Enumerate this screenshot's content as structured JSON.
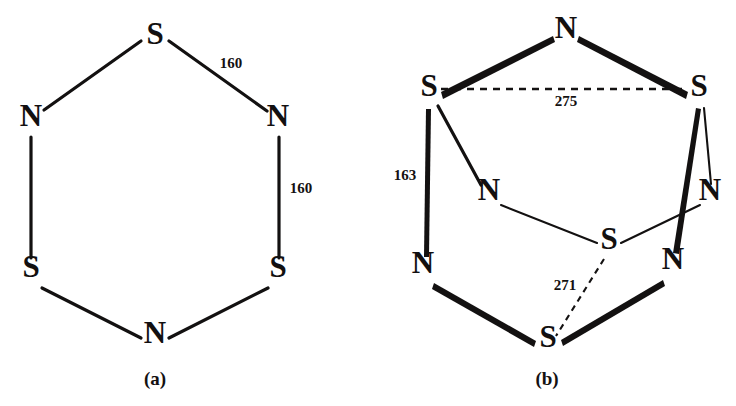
{
  "figure": {
    "background_color": "#ffffff",
    "ink_color": "#131111",
    "panels": [
      {
        "id": "panel-a",
        "caption": "(a)",
        "caption_pos": {
          "x": 155,
          "y": 385
        },
        "description": "planar six-membered S3N3 ring",
        "atoms": [
          {
            "id": "a-s-top",
            "label": "S",
            "x": 155,
            "y": 44
          },
          {
            "id": "a-n-left",
            "label": "N",
            "x": 31,
            "y": 126
          },
          {
            "id": "a-n-right",
            "label": "N",
            "x": 278,
            "y": 126
          },
          {
            "id": "a-s-left",
            "label": "S",
            "x": 31,
            "y": 277
          },
          {
            "id": "a-s-right",
            "label": "S",
            "x": 278,
            "y": 277
          },
          {
            "id": "a-n-bottom",
            "label": "N",
            "x": 155,
            "y": 343
          }
        ],
        "bonds": [
          {
            "from": "a-s-top",
            "to": "a-n-left",
            "style": "solid"
          },
          {
            "from": "a-s-top",
            "to": "a-n-right",
            "style": "solid"
          },
          {
            "from": "a-n-left",
            "to": "a-s-left",
            "style": "solid"
          },
          {
            "from": "a-n-right",
            "to": "a-s-right",
            "style": "solid"
          },
          {
            "from": "a-s-left",
            "to": "a-n-bottom",
            "style": "solid"
          },
          {
            "from": "a-s-right",
            "to": "a-n-bottom",
            "style": "solid"
          }
        ],
        "labels": [
          {
            "id": "a-dist-1",
            "text": "160",
            "x": 231,
            "y": 68,
            "bond": "S-N top right"
          },
          {
            "id": "a-dist-2",
            "text": "160",
            "x": 301,
            "y": 193,
            "bond": "N-S right vertical"
          }
        ]
      },
      {
        "id": "panel-b",
        "caption": "(b)",
        "caption_pos": {
          "x": 547,
          "y": 385
        },
        "description": "cage-like S4N4 structure with long S-S contacts",
        "atoms": [
          {
            "id": "b-n-top",
            "label": "N",
            "x": 566,
            "y": 38
          },
          {
            "id": "b-s-left",
            "label": "S",
            "x": 429,
            "y": 96
          },
          {
            "id": "b-s-right",
            "label": "S",
            "x": 699,
            "y": 96
          },
          {
            "id": "b-n-inleft",
            "label": "N",
            "x": 489,
            "y": 200
          },
          {
            "id": "b-n-inright",
            "label": "N",
            "x": 710,
            "y": 200
          },
          {
            "id": "b-s-center",
            "label": "S",
            "x": 609,
            "y": 249
          },
          {
            "id": "b-n-botleft",
            "label": "N",
            "x": 423,
            "y": 273
          },
          {
            "id": "b-n-botright",
            "label": "N",
            "x": 673,
            "y": 269
          },
          {
            "id": "b-s-bottom",
            "label": "S",
            "x": 548,
            "y": 347
          }
        ],
        "bonds": [
          {
            "from": "b-s-left",
            "to": "b-n-top",
            "style": "bold"
          },
          {
            "from": "b-s-right",
            "to": "b-n-top",
            "style": "bold"
          },
          {
            "from": "b-s-left",
            "to": "b-n-botleft",
            "style": "bold"
          },
          {
            "from": "b-s-left",
            "to": "b-n-inleft",
            "style": "medium"
          },
          {
            "from": "b-s-right",
            "to": "b-n-botright",
            "style": "bold"
          },
          {
            "from": "b-s-right",
            "to": "b-n-inright",
            "style": "thin"
          },
          {
            "from": "b-n-inleft",
            "to": "b-s-center",
            "style": "thin"
          },
          {
            "from": "b-s-center",
            "to": "b-n-inright",
            "style": "thin"
          },
          {
            "from": "b-n-botleft",
            "to": "b-s-bottom",
            "style": "bold"
          },
          {
            "from": "b-n-botright",
            "to": "b-s-bottom",
            "style": "bold"
          },
          {
            "from": "b-s-left",
            "to": "b-s-right",
            "style": "dashed"
          },
          {
            "from": "b-s-center",
            "to": "b-s-bottom",
            "style": "dashed"
          }
        ],
        "labels": [
          {
            "id": "b-dist-275",
            "text": "275",
            "x": 566,
            "y": 106,
            "bond": "S...S dashed horizontal"
          },
          {
            "id": "b-dist-163",
            "text": "163",
            "x": 405,
            "y": 180,
            "bond": "S-N left vertical"
          },
          {
            "id": "b-dist-271",
            "text": "271",
            "x": 565,
            "y": 290,
            "bond": "S...S dashed diagonal"
          }
        ]
      }
    ]
  }
}
